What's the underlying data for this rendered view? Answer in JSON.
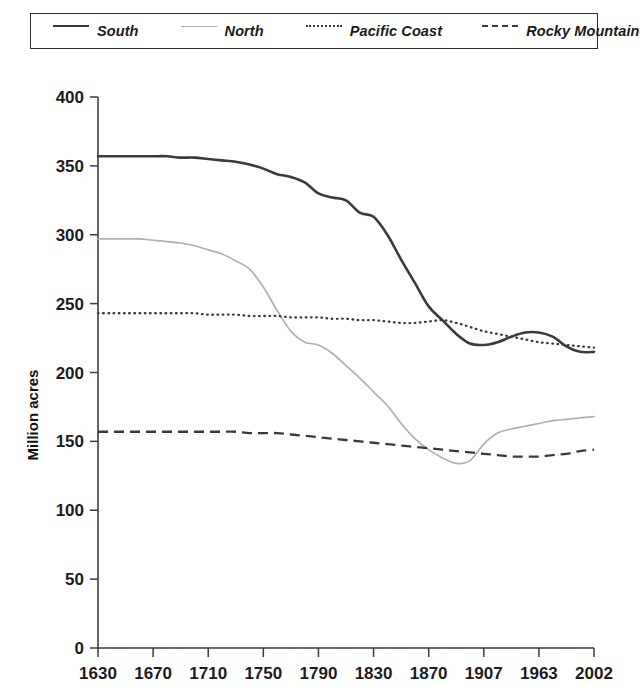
{
  "legend": {
    "position": "top",
    "items": [
      {
        "label": "South",
        "style": "solid-thick",
        "color": "#3a3a3a"
      },
      {
        "label": "North",
        "style": "solid-thin",
        "color": "#b0b0b0"
      },
      {
        "label": "Pacific Coast",
        "style": "dotted",
        "color": "#3a3a3a"
      },
      {
        "label": "Rocky Mountain",
        "style": "dashed",
        "color": "#3a3a3a"
      }
    ]
  },
  "chart_data": {
    "type": "line",
    "title": "",
    "xlabel": "",
    "ylabel": "Million acres",
    "grid": false,
    "legend_position": "top",
    "categories": [
      "1630",
      "1670",
      "1710",
      "1750",
      "1790",
      "1830",
      "1870",
      "1907",
      "1963",
      "2002"
    ],
    "x_tick_labels": [
      "1630",
      "1670",
      "1710",
      "1750",
      "1790",
      "1830",
      "1870",
      "1907",
      "1963",
      "2002"
    ],
    "y_tick_labels": [
      "0",
      "50",
      "100",
      "150",
      "200",
      "250",
      "300",
      "350",
      "400"
    ],
    "y_ticks": [
      0,
      50,
      100,
      150,
      200,
      250,
      300,
      350,
      400
    ],
    "ylim": [
      0,
      400
    ],
    "series": [
      {
        "name": "South",
        "color": "#3a3a3a",
        "style": "solid-thick",
        "values": [
          357,
          357,
          356,
          354,
          351,
          342,
          310,
          220,
          229,
          215
        ],
        "dense_values": [
          357,
          357,
          357,
          357,
          357,
          357,
          356,
          356,
          355,
          354,
          353,
          351,
          348,
          344,
          342,
          338,
          330,
          327,
          325,
          316,
          313,
          300,
          282,
          265,
          248,
          238,
          228,
          221,
          220,
          222,
          226,
          229,
          229,
          226,
          219,
          215,
          215
        ]
      },
      {
        "name": "North",
        "color": "#b0b0b0",
        "style": "solid-thin",
        "values": [
          297,
          297,
          296,
          294,
          289,
          275,
          205,
          140,
          160,
          168
        ],
        "dense_values": [
          297,
          297,
          297,
          297,
          296,
          295,
          294,
          292,
          289,
          286,
          281,
          275,
          262,
          245,
          230,
          222,
          220,
          214,
          205,
          196,
          186,
          176,
          163,
          152,
          144,
          138,
          134,
          136,
          148,
          156,
          159,
          161,
          163,
          165,
          166,
          167,
          168
        ]
      },
      {
        "name": "Pacific Coast",
        "color": "#3a3a3a",
        "style": "dotted",
        "values": [
          243,
          243,
          243,
          243,
          242,
          241,
          240,
          238,
          228,
          218
        ],
        "dense_values": [
          243,
          243,
          243,
          243,
          243,
          243,
          243,
          243,
          242,
          242,
          242,
          241,
          241,
          241,
          240,
          240,
          240,
          239,
          239,
          238,
          238,
          237,
          236,
          236,
          237,
          238,
          236,
          233,
          230,
          228,
          226,
          224,
          222,
          221,
          220,
          219,
          218
        ]
      },
      {
        "name": "Rocky Mountain",
        "color": "#3a3a3a",
        "style": "dashed",
        "values": [
          157,
          157,
          157,
          157,
          157,
          156,
          152,
          146,
          139,
          144
        ],
        "dense_values": [
          157,
          157,
          157,
          157,
          157,
          157,
          157,
          157,
          157,
          157,
          157,
          156,
          156,
          156,
          155,
          154,
          153,
          152,
          151,
          150,
          149,
          148,
          147,
          146,
          145,
          144,
          143,
          142,
          141,
          140,
          139,
          139,
          139,
          140,
          141,
          143,
          144
        ]
      }
    ]
  }
}
